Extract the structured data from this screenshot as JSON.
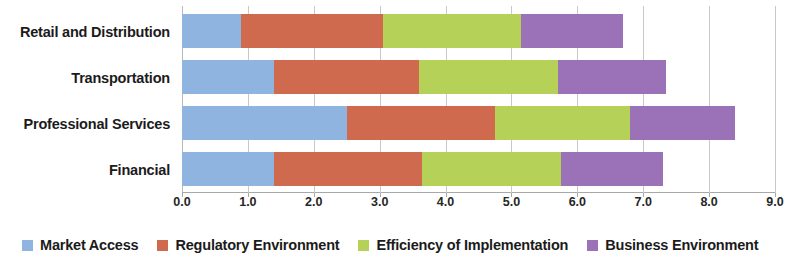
{
  "chart_data": {
    "type": "bar",
    "orientation": "horizontal",
    "stacked": true,
    "title": "",
    "xlabel": "",
    "ylabel": "",
    "xlim": [
      0.0,
      9.0
    ],
    "xticks": [
      "0.0",
      "1.0",
      "2.0",
      "3.0",
      "4.0",
      "5.0",
      "6.0",
      "7.0",
      "8.0",
      "9.0"
    ],
    "grid": true,
    "legend_position": "bottom",
    "categories": [
      "Retail and Distribution",
      "Transportation",
      "Professional Services",
      "Financial"
    ],
    "series": [
      {
        "name": "Market Access",
        "color": "#8fb4e0",
        "values": [
          0.9,
          1.4,
          2.5,
          1.4
        ]
      },
      {
        "name": "Regulatory Environment",
        "color": "#d06a4e",
        "values": [
          2.15,
          2.2,
          2.25,
          2.25
        ]
      },
      {
        "name": "Efficiency of Implementation",
        "color": "#b5d157",
        "values": [
          2.1,
          2.1,
          2.05,
          2.1
        ]
      },
      {
        "name": "Business Environment",
        "color": "#9b72b8",
        "values": [
          1.55,
          1.65,
          1.6,
          1.55
        ]
      }
    ],
    "totals": [
      6.7,
      7.35,
      8.4,
      7.3
    ]
  }
}
